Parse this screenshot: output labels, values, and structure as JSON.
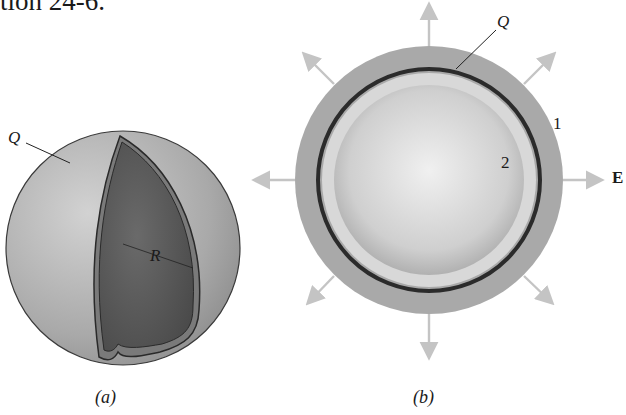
{
  "heading_fragment": "tion 24-6.",
  "figure_a": {
    "caption": "(a)",
    "charge_label": "Q",
    "radius_label": "R",
    "description": "charged spherical shell of radius R with cutaway"
  },
  "figure_b": {
    "caption": "(b)",
    "charge_label": "Q",
    "region_1_label": "1",
    "region_2_label": "2",
    "field_label": "E",
    "description": "cross-section of shell with radial field arrows"
  },
  "colors": {
    "shell_outer": "#a8a8a8",
    "shell_cut": "#5a5a5a",
    "ring": "#2b2b2b",
    "arrow": "#c4c4c4"
  }
}
